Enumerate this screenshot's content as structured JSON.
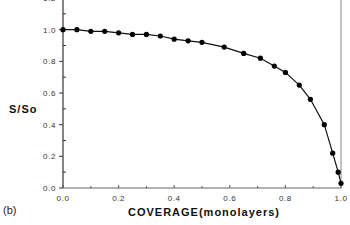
{
  "chart_data": {
    "type": "line",
    "title": "",
    "panel_label": "(b)",
    "xlabel": "COVERAGE(monolayers)",
    "ylabel": "S/So",
    "xlim": [
      0.0,
      1.0
    ],
    "ylim": [
      0.0,
      1.2
    ],
    "x_ticks": [
      "0.0",
      "0.2",
      "0.4",
      "0.6",
      "0.8",
      "1.0"
    ],
    "y_ticks": [
      "0.0",
      "0.2",
      "0.4",
      "0.6",
      "0.8",
      "1.0",
      "1.2"
    ],
    "grid": false,
    "legend": null,
    "markers": "filled-circle",
    "series": [
      {
        "name": "S/So",
        "x": [
          0.0,
          0.05,
          0.1,
          0.15,
          0.2,
          0.25,
          0.3,
          0.35,
          0.4,
          0.45,
          0.5,
          0.58,
          0.65,
          0.71,
          0.76,
          0.8,
          0.85,
          0.89,
          0.94,
          0.97,
          0.99,
          1.0
        ],
        "y": [
          1.0,
          1.0,
          0.99,
          0.99,
          0.98,
          0.97,
          0.97,
          0.96,
          0.94,
          0.93,
          0.92,
          0.89,
          0.85,
          0.82,
          0.77,
          0.73,
          0.65,
          0.56,
          0.4,
          0.22,
          0.1,
          0.03
        ]
      }
    ]
  }
}
